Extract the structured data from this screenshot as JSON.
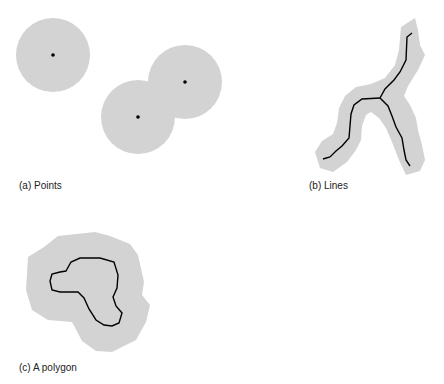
{
  "figures": [
    {
      "id": "a",
      "caption": "(a) Points",
      "feature_type": "points",
      "point_count": 3
    },
    {
      "id": "b",
      "caption": "(b) Lines",
      "feature_type": "lines",
      "branch_count": 3
    },
    {
      "id": "c",
      "caption": "(c) A polygon",
      "feature_type": "polygon"
    }
  ],
  "colors": {
    "buffer_fill": "#d3d3d3",
    "feature_stroke": "#000000",
    "background": "#ffffff"
  }
}
